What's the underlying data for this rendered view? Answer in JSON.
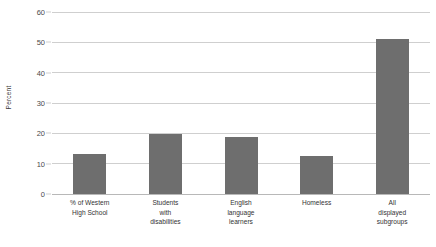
{
  "chart_data": {
    "type": "bar",
    "title": "",
    "subtitle": "",
    "xlabel": "",
    "ylabel": "Percent",
    "ylim": [
      0,
      60
    ],
    "ytick_values": [
      0,
      10,
      20,
      30,
      40,
      50,
      60
    ],
    "ytick_labels": [
      "0",
      "10",
      "20",
      "30",
      "40",
      "50",
      "60"
    ],
    "grid": true,
    "legend": false,
    "legend_position": "none",
    "bar_color": "#6e6e6e",
    "gridline_color": "#cfcfcf",
    "categories": [
      "% of Western High School",
      "Students with disabilities",
      "English language learners",
      "Homeless",
      "All displayed subgroups"
    ],
    "category_lines": [
      [
        "% of Western",
        "High School"
      ],
      [
        "Students",
        "with",
        "disabilities"
      ],
      [
        "English",
        "language",
        "learners"
      ],
      [
        "Homeless"
      ],
      [
        "All",
        "displayed",
        "subgroups"
      ]
    ],
    "values": [
      13.3,
      19.8,
      18.8,
      12.5,
      51.0
    ]
  }
}
